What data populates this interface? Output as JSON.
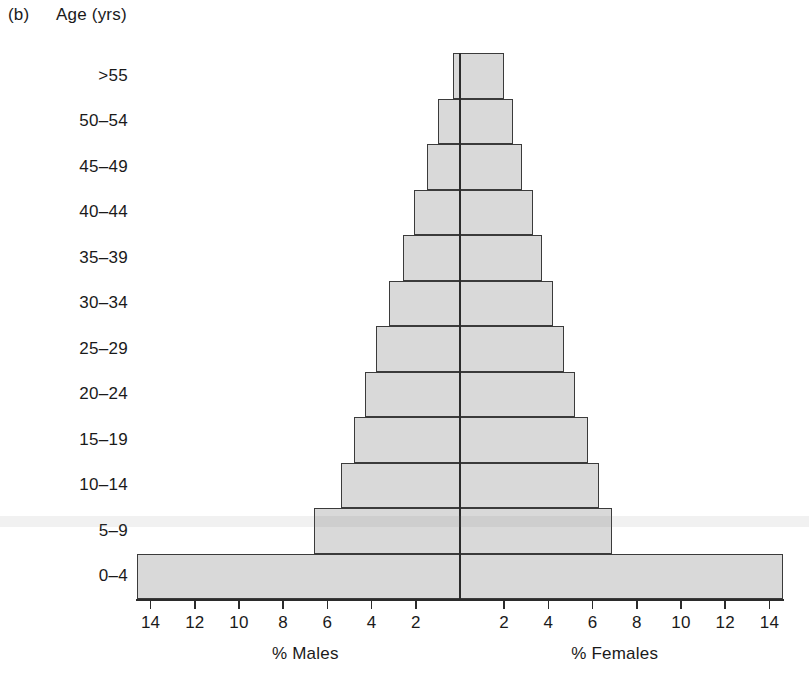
{
  "panel": {
    "label": "(b)"
  },
  "axis_title_y": "Age (yrs)",
  "captions": {
    "left": "% Males",
    "right": "% Females"
  },
  "colors": {
    "bar_fill": "#d9d9d9",
    "bar_stroke": "#3b3b3b",
    "axis": "#2b2b2b",
    "text": "#1a1a1a",
    "background": "#ffffff"
  },
  "chart_data": {
    "type": "bar",
    "subtype": "population-pyramid",
    "title": "",
    "xlabel": "",
    "ylabel": "Age (yrs)",
    "left_axis_label": "% Males",
    "right_axis_label": "% Females",
    "grid": false,
    "legend": "none",
    "orientation": "horizontal",
    "xlim": [
      -15.2,
      15.2
    ],
    "tick_values_left": [
      14,
      12,
      10,
      8,
      6,
      4,
      2
    ],
    "tick_values_right": [
      2,
      4,
      6,
      8,
      10,
      12,
      14
    ],
    "tick_labels_left": [
      "14",
      "12",
      "10",
      "8",
      "6",
      "4",
      "2"
    ],
    "tick_labels_right": [
      "2",
      "4",
      "6",
      "8",
      "10",
      "12",
      "14"
    ],
    "categories": [
      ">55",
      "50–54",
      "45–49",
      "40–44",
      "35–39",
      "30–34",
      "25–29",
      "20–24",
      "15–19",
      "10–14",
      "5–9",
      "0–4"
    ],
    "series": [
      {
        "name": "% Males",
        "side": "left",
        "values": [
          0.3,
          1.0,
          1.5,
          2.1,
          2.6,
          3.2,
          3.8,
          4.3,
          4.8,
          5.4,
          6.6,
          14.6
        ]
      },
      {
        "name": "% Females",
        "side": "right",
        "values": [
          2.0,
          2.4,
          2.8,
          3.3,
          3.7,
          4.2,
          4.7,
          5.2,
          5.8,
          6.3,
          6.9,
          14.6
        ]
      }
    ]
  },
  "geometry": {
    "center_x": 460,
    "baseline_y": 600,
    "px_per_unit": 22.1,
    "row_height": 45.5,
    "top_y": 53
  }
}
